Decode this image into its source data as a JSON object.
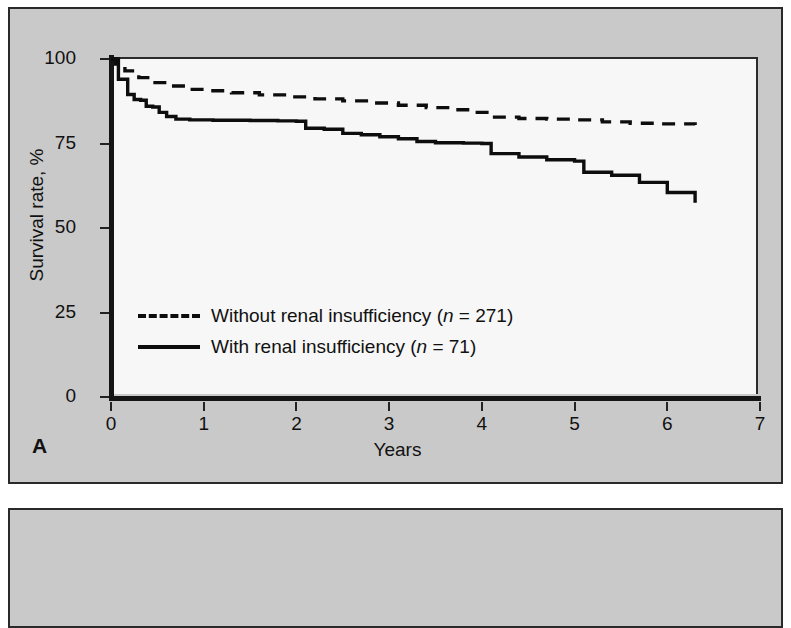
{
  "figure": {
    "panel_a_letter": "A",
    "background_color": "#c9c9c9",
    "plot_background_color": "#f7f7f7",
    "line_color": "#0d0d0d"
  },
  "chart_data": {
    "type": "line",
    "title": "",
    "xlabel": "Years",
    "ylabel": "Survival rate, %",
    "xlim": [
      0,
      7
    ],
    "ylim": [
      0,
      100
    ],
    "xticks": [
      0,
      1,
      2,
      3,
      4,
      5,
      6,
      7
    ],
    "yticks": [
      0,
      25,
      50,
      75,
      100
    ],
    "xtick_labels": [
      "0",
      "1",
      "2",
      "3",
      "4",
      "5",
      "6",
      "7"
    ],
    "ytick_labels": [
      "0",
      "25",
      "50",
      "75",
      "100"
    ],
    "grid": false,
    "legend_position": "lower left",
    "curve_style": "kaplan-meier step",
    "series": [
      {
        "name": "Without renal insufficiency (n = 271)",
        "label_prefix": "Without renal insufficiency (",
        "label_n": "n",
        "label_suffix": " = 271)",
        "n": 271,
        "style": "dashed",
        "color": "#0d0d0d",
        "points": [
          [
            0.0,
            100.0
          ],
          [
            0.05,
            98.5
          ],
          [
            0.15,
            96.5
          ],
          [
            0.3,
            94.5
          ],
          [
            0.45,
            93.0
          ],
          [
            0.6,
            92.0
          ],
          [
            0.8,
            91.0
          ],
          [
            1.0,
            90.6
          ],
          [
            1.3,
            90.0
          ],
          [
            1.6,
            89.4
          ],
          [
            1.9,
            88.8
          ],
          [
            2.2,
            88.2
          ],
          [
            2.5,
            87.6
          ],
          [
            2.8,
            87.0
          ],
          [
            3.1,
            86.3
          ],
          [
            3.4,
            85.6
          ],
          [
            3.7,
            85.0
          ],
          [
            3.9,
            84.2
          ],
          [
            4.1,
            82.8
          ],
          [
            4.4,
            82.4
          ],
          [
            4.7,
            82.2
          ],
          [
            5.0,
            82.0
          ],
          [
            5.3,
            81.4
          ],
          [
            5.6,
            81.0
          ],
          [
            5.9,
            80.8
          ],
          [
            6.3,
            80.5
          ]
        ]
      },
      {
        "name": "With renal insufficiency (n = 71)",
        "label_prefix": "With renal insufficiency (",
        "label_n": "n",
        "label_suffix": " = 71)",
        "n": 71,
        "style": "solid",
        "color": "#0d0d0d",
        "points": [
          [
            0.0,
            100.0
          ],
          [
            0.08,
            94.0
          ],
          [
            0.18,
            89.5
          ],
          [
            0.25,
            88.0
          ],
          [
            0.32,
            87.8
          ],
          [
            0.38,
            86.0
          ],
          [
            0.45,
            85.8
          ],
          [
            0.52,
            84.2
          ],
          [
            0.6,
            83.0
          ],
          [
            0.7,
            82.2
          ],
          [
            0.85,
            82.0
          ],
          [
            1.1,
            81.9
          ],
          [
            1.5,
            81.8
          ],
          [
            1.8,
            81.7
          ],
          [
            2.0,
            81.6
          ],
          [
            2.1,
            79.5
          ],
          [
            2.3,
            79.2
          ],
          [
            2.5,
            78.0
          ],
          [
            2.7,
            77.6
          ],
          [
            2.9,
            77.0
          ],
          [
            3.1,
            76.4
          ],
          [
            3.3,
            75.6
          ],
          [
            3.5,
            75.2
          ],
          [
            3.8,
            75.1
          ],
          [
            4.0,
            75.0
          ],
          [
            4.1,
            72.0
          ],
          [
            4.4,
            71.0
          ],
          [
            4.7,
            70.2
          ],
          [
            5.0,
            69.8
          ],
          [
            5.1,
            66.5
          ],
          [
            5.4,
            65.6
          ],
          [
            5.7,
            63.5
          ],
          [
            6.0,
            60.5
          ],
          [
            6.3,
            57.5
          ]
        ]
      }
    ]
  }
}
